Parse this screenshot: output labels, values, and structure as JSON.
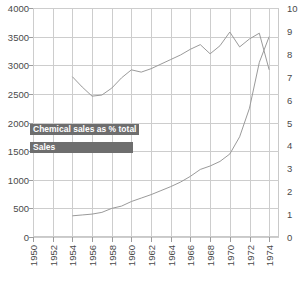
{
  "chart_data": {
    "type": "line",
    "title": "",
    "xlabel": "",
    "ylabel": "",
    "grid": true,
    "legend_position": "inside-left",
    "x": [
      1954,
      1955,
      1956,
      1957,
      1958,
      1959,
      1960,
      1961,
      1962,
      1963,
      1964,
      1965,
      1966,
      1967,
      1968,
      1969,
      1970,
      1971,
      1972,
      1973,
      1974
    ],
    "xlim": [
      1950,
      1975
    ],
    "xticks": [
      "1950",
      "1952",
      "1954",
      "1956",
      "1958",
      "1960",
      "1962",
      "1964",
      "1966",
      "1968",
      "1970",
      "1972",
      "1974"
    ],
    "left_axis": {
      "label": "Sales",
      "ylim": [
        0,
        4000
      ],
      "yticks": [
        "0",
        "500",
        "1000",
        "1500",
        "2000",
        "2500",
        "3000",
        "3500",
        "4000"
      ]
    },
    "right_axis": {
      "label": "Chemical sales as % total",
      "ylim": [
        0,
        10
      ],
      "yticks": [
        "0",
        "1",
        "2",
        "3",
        "4",
        "5",
        "6",
        "7",
        "8",
        "9",
        "10"
      ]
    },
    "series": [
      {
        "name": "Chemical sales as % total",
        "axis": "right",
        "color": "#9a9a9a",
        "values": [
          7.0,
          6.55,
          6.15,
          6.2,
          6.5,
          6.95,
          7.3,
          7.2,
          7.35,
          7.55,
          7.75,
          7.95,
          8.2,
          8.4,
          8.0,
          8.35,
          8.95,
          8.3,
          8.65,
          8.9,
          7.3
        ]
      },
      {
        "name": "Sales",
        "axis": "left",
        "color": "#9a9a9a",
        "values": [
          370,
          385,
          400,
          430,
          500,
          540,
          620,
          680,
          740,
          810,
          880,
          960,
          1060,
          1180,
          1240,
          1320,
          1450,
          1750,
          2250,
          3050,
          3500
        ]
      }
    ]
  },
  "legend": {
    "pct_label": "Chemical sales as % total",
    "sales_label": "Sales"
  }
}
